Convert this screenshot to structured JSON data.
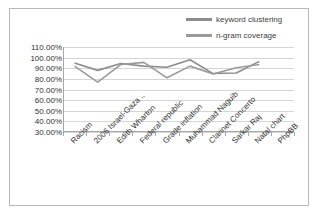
{
  "chart_data": {
    "type": "line",
    "title": "",
    "xlabel": "",
    "ylabel": "",
    "categories": [
      "Racism",
      "2006 Israel-Gaza ..",
      "Edith Wharton",
      "Federal republic",
      "Grade inflation",
      "Muhammad Naguib",
      "Clarinet Concerto",
      "Sarkar Raj",
      "Natal chart",
      "PhpBB"
    ],
    "series": [
      {
        "name": "keyword clustering",
        "color": "#8c8c8c",
        "values": [
          95.0,
          88.0,
          94.5,
          92.0,
          91.0,
          98.0,
          85.0,
          85.5,
          96.5,
          null
        ]
      },
      {
        "name": "n-gram coverage",
        "color": "#9a9a9a",
        "values": [
          92.0,
          77.0,
          93.5,
          95.5,
          81.0,
          92.0,
          84.5,
          90.5,
          93.5,
          null
        ]
      }
    ],
    "ylim": [
      30,
      110
    ],
    "ytick_labels": [
      "110.00%",
      "100.00%",
      "90.00%",
      "80.00%",
      "70.00%",
      "60.00%",
      "50.00%",
      "40.00%",
      "30.00%"
    ],
    "ytick_values": [
      110,
      100,
      90,
      80,
      70,
      60,
      50,
      40,
      30
    ],
    "grid": true,
    "legend_position": "top-right",
    "legend": [
      "keyword clustering",
      "n-gram coverage"
    ],
    "plot_border_color": "#b9b9b9",
    "gridline_color": "#d5d5d5",
    "background_color": "#ffffff"
  }
}
